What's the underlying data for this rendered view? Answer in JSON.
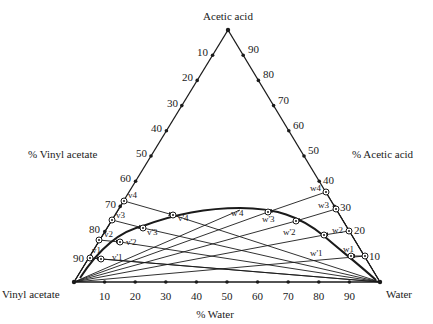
{
  "diagram": {
    "type": "ternary",
    "vertices": {
      "top": "Acetic acid",
      "bottom_left": "Vinyl acetate",
      "bottom_right": "Water"
    },
    "axis_titles": {
      "left": "% Vinyl acetate",
      "right": "% Acetic acid",
      "bottom": "% Water"
    },
    "left_ticks": [
      "10",
      "20",
      "30",
      "40",
      "50",
      "60",
      "70",
      "80",
      "90"
    ],
    "right_ticks": [
      "90",
      "80",
      "70",
      "60",
      "50",
      "40",
      "30",
      "20",
      "10"
    ],
    "bottom_ticks": [
      "10",
      "20",
      "30",
      "40",
      "50",
      "60",
      "70",
      "80",
      "90"
    ],
    "points": {
      "v1": "v1",
      "v2": "v2",
      "v3": "v3",
      "v4": "v4",
      "v1p": "v'1",
      "v2p": "v'2",
      "v3p": "v'3",
      "v4p": "v'4",
      "w1": "w1",
      "w2": "w2",
      "w3": "w3",
      "w4": "w4",
      "w1p": "w'1",
      "w2p": "w'2",
      "w3p": "w'3",
      "w4p": "w'4"
    }
  }
}
